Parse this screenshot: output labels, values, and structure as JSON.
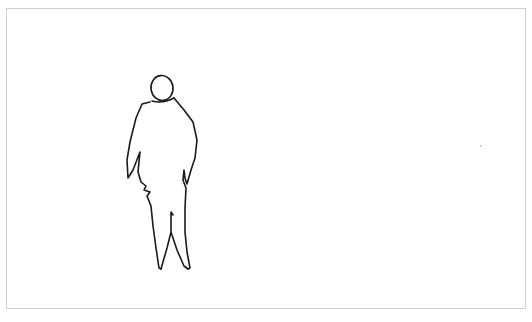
{
  "image": {
    "description": "Minimal line sketch of a standing stout human figure on a white background inside a thin gray frame",
    "subject": "standing-figure-sketch",
    "background_color": "#ffffff",
    "frame_color": "#cfcfcf",
    "stroke_color": "#1a1a1a"
  }
}
